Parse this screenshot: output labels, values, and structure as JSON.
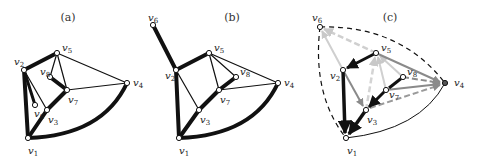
{
  "panels": [
    {
      "caption": "(a)",
      "nodes": [
        {
          "id": "v1",
          "x": 28,
          "y": 138
        },
        {
          "id": "v2",
          "x": 24,
          "y": 70
        },
        {
          "id": "v3",
          "x": 47,
          "y": 110
        },
        {
          "id": "v4",
          "x": 127,
          "y": 83
        },
        {
          "id": "v5",
          "x": 57,
          "y": 53
        },
        {
          "id": "v6",
          "x": 35,
          "y": 105
        },
        {
          "id": "v7",
          "x": 67,
          "y": 90
        },
        {
          "id": "v8",
          "x": 50,
          "y": 77
        }
      ],
      "labels": [
        {
          "id": "v1",
          "x": 28,
          "y": 154
        },
        {
          "id": "v2",
          "x": 14,
          "y": 65
        },
        {
          "id": "v3",
          "x": 48,
          "y": 123
        },
        {
          "id": "v4",
          "x": 133,
          "y": 86
        },
        {
          "id": "v5",
          "x": 62,
          "y": 51
        },
        {
          "id": "v6",
          "x": 34,
          "y": 117
        },
        {
          "id": "v7",
          "x": 68,
          "y": 103
        },
        {
          "id": "v8",
          "x": 40,
          "y": 75
        }
      ],
      "edges": [
        {
          "from": "v1",
          "to": "v2",
          "w": 4
        },
        {
          "from": "v2",
          "to": "v5",
          "w": 4
        },
        {
          "from": "v2",
          "to": "v6",
          "w": 3
        },
        {
          "from": "v2",
          "to": "v3",
          "w": 1.2
        },
        {
          "from": "v1",
          "to": "v3",
          "w": 4
        },
        {
          "from": "v3",
          "to": "v7",
          "w": 4
        },
        {
          "from": "v7",
          "to": "v8",
          "w": 4
        },
        {
          "from": "v5",
          "to": "v8",
          "w": 1.2
        },
        {
          "from": "v5",
          "to": "v7",
          "w": 1.2
        },
        {
          "from": "v5",
          "to": "v4",
          "w": 1.2
        },
        {
          "from": "v7",
          "to": "v4",
          "w": 1.2
        },
        {
          "from": "v1",
          "to": "v4",
          "w": 4,
          "curve": true
        }
      ]
    },
    {
      "caption": "(b)",
      "nodes": [
        {
          "id": "v1",
          "x": 179,
          "y": 138
        },
        {
          "id": "v2",
          "x": 176,
          "y": 70
        },
        {
          "id": "v3",
          "x": 199,
          "y": 110
        },
        {
          "id": "v4",
          "x": 278,
          "y": 83
        },
        {
          "id": "v5",
          "x": 209,
          "y": 53
        },
        {
          "id": "v6",
          "x": 153,
          "y": 25
        },
        {
          "id": "v7",
          "x": 219,
          "y": 90
        },
        {
          "id": "v8",
          "x": 236,
          "y": 77
        }
      ],
      "labels": [
        {
          "id": "v1",
          "x": 179,
          "y": 154
        },
        {
          "id": "v2",
          "x": 165,
          "y": 79
        },
        {
          "id": "v3",
          "x": 200,
          "y": 123
        },
        {
          "id": "v4",
          "x": 284,
          "y": 86
        },
        {
          "id": "v5",
          "x": 214,
          "y": 51
        },
        {
          "id": "v6",
          "x": 148,
          "y": 21
        },
        {
          "id": "v7",
          "x": 220,
          "y": 103
        },
        {
          "id": "v8",
          "x": 240,
          "y": 75
        }
      ],
      "edges": [
        {
          "from": "v6",
          "to": "v2",
          "w": 4
        },
        {
          "from": "v1",
          "to": "v2",
          "w": 4
        },
        {
          "from": "v2",
          "to": "v5",
          "w": 4
        },
        {
          "from": "v2",
          "to": "v3",
          "w": 1.2
        },
        {
          "from": "v1",
          "to": "v3",
          "w": 4
        },
        {
          "from": "v3",
          "to": "v7",
          "w": 4
        },
        {
          "from": "v7",
          "to": "v8",
          "w": 4
        },
        {
          "from": "v5",
          "to": "v8",
          "w": 1.2
        },
        {
          "from": "v5",
          "to": "v7",
          "w": 1.2
        },
        {
          "from": "v5",
          "to": "v4",
          "w": 1.2
        },
        {
          "from": "v7",
          "to": "v4",
          "w": 1.2
        },
        {
          "from": "v1",
          "to": "v4",
          "w": 4,
          "curve": true
        }
      ]
    },
    {
      "caption": "(c)",
      "nodes": [
        {
          "id": "v1",
          "x": 346,
          "y": 138
        },
        {
          "id": "v2",
          "x": 343,
          "y": 70
        },
        {
          "id": "v3",
          "x": 366,
          "y": 110
        },
        {
          "id": "v4",
          "x": 445,
          "y": 83
        },
        {
          "id": "v5",
          "x": 376,
          "y": 53
        },
        {
          "id": "v6",
          "x": 320,
          "y": 27
        },
        {
          "id": "v7",
          "x": 386,
          "y": 90
        },
        {
          "id": "v8",
          "x": 403,
          "y": 77
        }
      ],
      "labels": [
        {
          "id": "v1",
          "x": 347,
          "y": 154
        },
        {
          "id": "v2",
          "x": 330,
          "y": 79
        },
        {
          "id": "v3",
          "x": 367,
          "y": 123
        },
        {
          "id": "v4",
          "x": 454,
          "y": 86
        },
        {
          "id": "v5",
          "x": 381,
          "y": 51
        },
        {
          "id": "v6",
          "x": 312,
          "y": 21
        },
        {
          "id": "v7",
          "x": 389,
          "y": 98
        },
        {
          "id": "v8",
          "x": 407,
          "y": 75
        }
      ]
    }
  ]
}
